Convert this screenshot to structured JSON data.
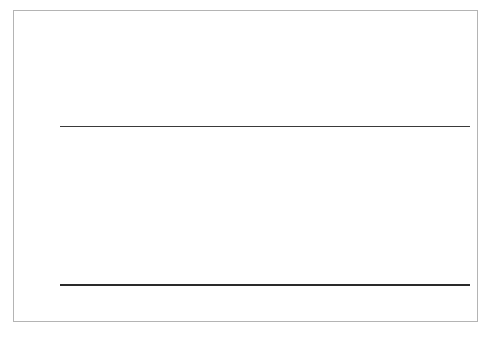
{
  "figure": {
    "background_color": "#ffffff",
    "frame_color": "#b4b4b4"
  },
  "chart_data": {
    "type": "bar",
    "xlabel": "",
    "ylabel": "",
    "categories": [
      "< 25",
      "25–34",
      "35–44",
      "45–54",
      "55–64",
      "65–74",
      "75+"
    ],
    "values": [
      52,
      95,
      116,
      141,
      112,
      82,
      35
    ],
    "value_labels": [
      "52",
      "95",
      "116",
      "141",
      "112",
      "82",
      "35"
    ],
    "series": [
      {
        "name": "Indexed spending",
        "values": [
          52,
          95,
          116,
          141,
          112,
          82,
          35
        ],
        "color": "#6e6e6e"
      }
    ],
    "reference_line": {
      "value": 100,
      "label_lines": [
        "100 =",
        "average",
        "spending"
      ],
      "color": "#3a3a3a"
    },
    "ylim": [
      0,
      150
    ],
    "grid": false,
    "legend": false,
    "axis_color": "#2a2a2a",
    "bar_color": "#6e6e6e"
  }
}
